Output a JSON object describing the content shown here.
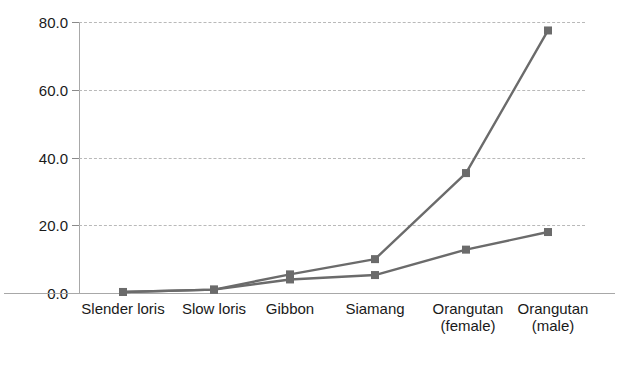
{
  "chart_data": {
    "type": "line",
    "title": "",
    "subtitle": "",
    "xlabel": "",
    "ylabel": "",
    "categories": [
      "Slender loris",
      "Slow loris",
      "Gibbon",
      "Siamang",
      "Orangutan\n(female)",
      "Orangutan\n(male)"
    ],
    "series": [
      {
        "name": "series-1",
        "values": [
          0.3,
          1.0,
          5.5,
          10.0,
          35.4,
          77.5
        ]
      },
      {
        "name": "series-2",
        "values": [
          0.3,
          1.0,
          4.0,
          5.3,
          12.8,
          18.0
        ]
      }
    ],
    "ylim": [
      0,
      80
    ],
    "yticks": [
      0,
      20,
      40,
      60,
      80
    ],
    "ytick_labels": [
      "0.0",
      "20.0",
      "40.0",
      "60.0",
      "80.0"
    ],
    "grid": true,
    "grid_style": "dashed-horizontal",
    "legend": "none",
    "marker": "square",
    "series_color": "#6b6b6b",
    "grid_color": "#b9b9b9",
    "axis_color": "#a8a8a8",
    "text_color": "#1a1a1a"
  }
}
